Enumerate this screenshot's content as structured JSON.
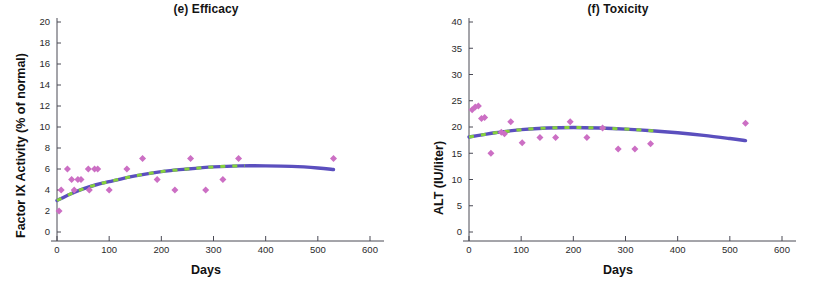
{
  "figure": {
    "background_color": "#ffffff",
    "marker_color": "#cc6fc4",
    "fit_line_color": "#5b4fbe",
    "fit_dash_color": "#86d23c"
  },
  "panels": [
    {
      "id": "efficacy",
      "title": "(e) Efficacy",
      "xlabel": "Days",
      "ylabel": "Factor IX Activity (% of normal)"
    },
    {
      "id": "toxicity",
      "title": "(f) Toxicity",
      "xlabel": "Days",
      "ylabel": "ALT (IU/liter)"
    }
  ],
  "chart_data": [
    {
      "type": "scatter",
      "title": "(e) Efficacy",
      "xlabel": "Days",
      "ylabel": "Factor IX Activity (% of normal)",
      "xlim": [
        0,
        600
      ],
      "ylim": [
        0,
        20
      ],
      "xticks": [
        0,
        100,
        200,
        300,
        400,
        500,
        600
      ],
      "yticks": [
        0,
        2,
        4,
        6,
        8,
        10,
        12,
        14,
        16,
        18,
        20
      ],
      "grid": false,
      "legend": null,
      "series": [
        {
          "name": "Factor IX activity measurements",
          "marker": "diamond",
          "color": "#cc6fc4",
          "points": [
            {
              "x": 4,
              "y": 2
            },
            {
              "x": 8,
              "y": 4
            },
            {
              "x": 20,
              "y": 6
            },
            {
              "x": 28,
              "y": 5
            },
            {
              "x": 33,
              "y": 4
            },
            {
              "x": 40,
              "y": 5
            },
            {
              "x": 46,
              "y": 5
            },
            {
              "x": 60,
              "y": 6
            },
            {
              "x": 62,
              "y": 4
            },
            {
              "x": 72,
              "y": 6
            },
            {
              "x": 78,
              "y": 6
            },
            {
              "x": 100,
              "y": 4
            },
            {
              "x": 134,
              "y": 6
            },
            {
              "x": 164,
              "y": 7
            },
            {
              "x": 192,
              "y": 5
            },
            {
              "x": 226,
              "y": 4
            },
            {
              "x": 256,
              "y": 7
            },
            {
              "x": 285,
              "y": 4
            },
            {
              "x": 318,
              "y": 5
            },
            {
              "x": 348,
              "y": 7
            },
            {
              "x": 530,
              "y": 7
            }
          ]
        },
        {
          "name": "Fitted trend (blue solid)",
          "type": "line",
          "color": "#5b4fbe",
          "points": [
            {
              "x": 0,
              "y": 3.0
            },
            {
              "x": 25,
              "y": 3.6
            },
            {
              "x": 50,
              "y": 4.1
            },
            {
              "x": 75,
              "y": 4.5
            },
            {
              "x": 100,
              "y": 4.8
            },
            {
              "x": 150,
              "y": 5.35
            },
            {
              "x": 200,
              "y": 5.75
            },
            {
              "x": 250,
              "y": 6.0
            },
            {
              "x": 300,
              "y": 6.2
            },
            {
              "x": 350,
              "y": 6.3
            },
            {
              "x": 400,
              "y": 6.3
            },
            {
              "x": 450,
              "y": 6.25
            },
            {
              "x": 500,
              "y": 6.1
            },
            {
              "x": 530,
              "y": 5.95
            }
          ]
        },
        {
          "name": "Fitted trend (green dashed overlay)",
          "type": "line",
          "color": "#86d23c",
          "dashed": true,
          "x_range": [
            0,
            360
          ]
        }
      ]
    },
    {
      "type": "scatter",
      "title": "(f) Toxicity",
      "xlabel": "Days",
      "ylabel": "ALT (IU/liter)",
      "xlim": [
        0,
        600
      ],
      "ylim": [
        0,
        40
      ],
      "xticks": [
        0,
        100,
        200,
        300,
        400,
        500,
        600
      ],
      "yticks": [
        0,
        5,
        10,
        15,
        20,
        25,
        30,
        35,
        40
      ],
      "grid": false,
      "legend": null,
      "series": [
        {
          "name": "ALT measurements",
          "marker": "diamond",
          "color": "#cc6fc4",
          "points": [
            {
              "x": 6,
              "y": 23.3
            },
            {
              "x": 12,
              "y": 23.8
            },
            {
              "x": 18,
              "y": 24.0
            },
            {
              "x": 24,
              "y": 21.6
            },
            {
              "x": 30,
              "y": 21.8
            },
            {
              "x": 42,
              "y": 15.0
            },
            {
              "x": 62,
              "y": 19.0
            },
            {
              "x": 68,
              "y": 18.7
            },
            {
              "x": 80,
              "y": 21.0
            },
            {
              "x": 102,
              "y": 17.0
            },
            {
              "x": 136,
              "y": 18.0
            },
            {
              "x": 166,
              "y": 18.0
            },
            {
              "x": 194,
              "y": 21.0
            },
            {
              "x": 226,
              "y": 18.0
            },
            {
              "x": 256,
              "y": 19.8
            },
            {
              "x": 286,
              "y": 15.8
            },
            {
              "x": 318,
              "y": 15.8
            },
            {
              "x": 348,
              "y": 16.8
            },
            {
              "x": 530,
              "y": 20.7
            }
          ]
        },
        {
          "name": "Fitted trend (blue solid)",
          "type": "line",
          "color": "#5b4fbe",
          "points": [
            {
              "x": 0,
              "y": 18.1
            },
            {
              "x": 25,
              "y": 18.5
            },
            {
              "x": 50,
              "y": 18.9
            },
            {
              "x": 75,
              "y": 19.2
            },
            {
              "x": 100,
              "y": 19.5
            },
            {
              "x": 150,
              "y": 19.8
            },
            {
              "x": 200,
              "y": 19.9
            },
            {
              "x": 250,
              "y": 19.8
            },
            {
              "x": 300,
              "y": 19.6
            },
            {
              "x": 350,
              "y": 19.3
            },
            {
              "x": 400,
              "y": 18.9
            },
            {
              "x": 450,
              "y": 18.4
            },
            {
              "x": 500,
              "y": 17.8
            },
            {
              "x": 530,
              "y": 17.4
            }
          ]
        },
        {
          "name": "Fitted trend (green dashed overlay)",
          "type": "line",
          "color": "#86d23c",
          "dashed": true,
          "x_range": [
            0,
            360
          ]
        }
      ]
    }
  ]
}
